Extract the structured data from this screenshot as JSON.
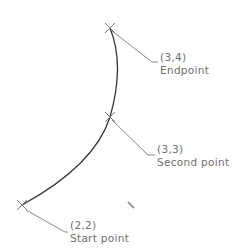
{
  "diagram": {
    "colors": {
      "arc": "#333333",
      "leader": "#8a8a8a",
      "text": "#707070",
      "marker": "#777777"
    },
    "points": [
      {
        "id": "endpoint",
        "coord": "(3,4)",
        "label": "Endpoint",
        "x": 110,
        "y": 28
      },
      {
        "id": "second",
        "coord": "(3,3)",
        "label": "Second point",
        "x": 110,
        "y": 117
      },
      {
        "id": "start",
        "coord": "(2,2)",
        "label": "Start point",
        "x": 22,
        "y": 205
      }
    ]
  }
}
